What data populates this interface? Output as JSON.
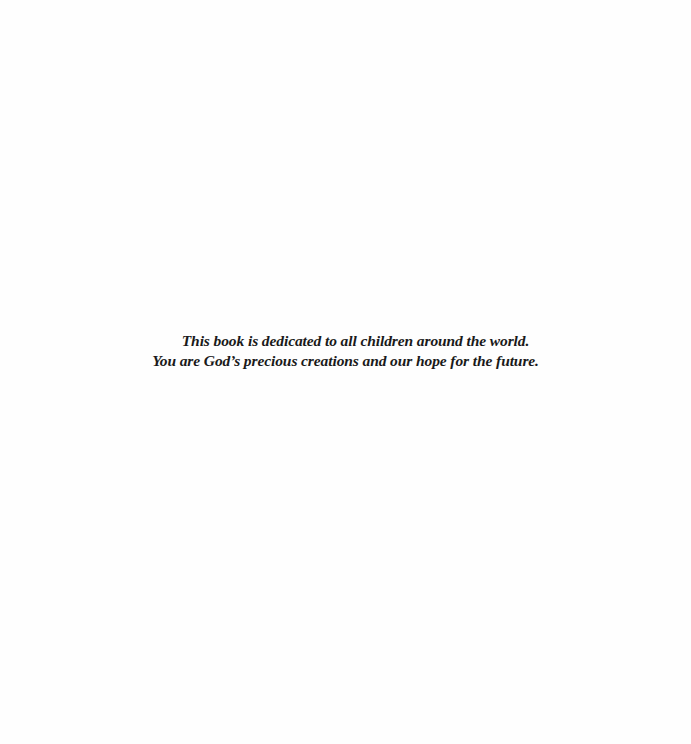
{
  "page": {
    "background_color": "#fefefe",
    "text_color": "#1a1a1a"
  },
  "dedication": {
    "lines": [
      "This book is dedicated to all children around the world.",
      "You are God’s precious creations and our hope for the future."
    ]
  }
}
